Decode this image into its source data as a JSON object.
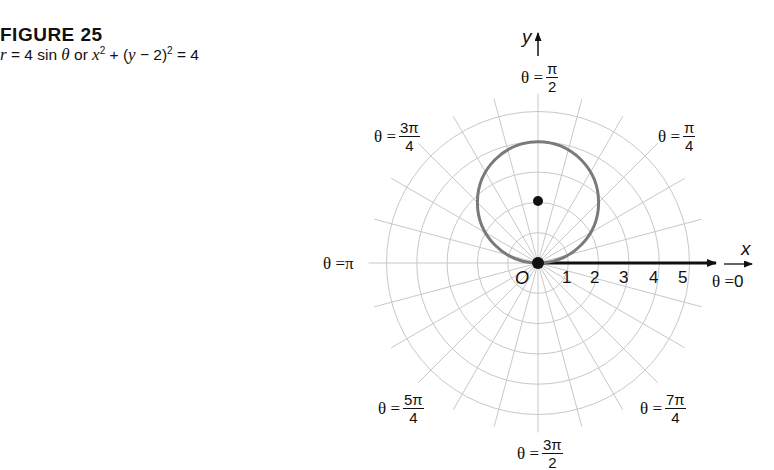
{
  "figure": {
    "title": "FIGURE 25",
    "caption": {
      "r": "r",
      "eq1": " = 4 sin ",
      "theta": "θ",
      "or": " or ",
      "x": "x",
      "exp1": "2",
      "mid": " + (",
      "y": "y",
      "mid2": " − 2)",
      "exp2": "2",
      "end": " = 4"
    }
  },
  "chart_data": {
    "type": "polar",
    "title": "FIGURE 25",
    "subtitle": "r = 4 sin θ or x² + (y − 2)² = 4",
    "equation_polar": "r = 4 sin θ",
    "equation_rectangular": "x^2 + (y - 2)^2 = 4",
    "curve": {
      "shape": "circle",
      "center_xy": [
        0,
        2
      ],
      "radius": 2,
      "color": "#7a7a7a"
    },
    "points": [
      {
        "label": "pole",
        "x": 0,
        "y": 0
      },
      {
        "label": "center",
        "x": 0,
        "y": 2
      }
    ],
    "grid": {
      "on": true,
      "rings": [
        1,
        2,
        3,
        4,
        5
      ],
      "radial_step_deg": 15,
      "color": "#c8c8c8"
    },
    "polar_axis_ticks": [
      "1",
      "2",
      "3",
      "4",
      "5"
    ],
    "pole_label": "O",
    "xlabel": "x",
    "ylabel": "y",
    "angle_labels": [
      {
        "prefix": "θ = ",
        "num": "",
        "den": "",
        "whole": "0",
        "angle": "0"
      },
      {
        "prefix": "θ = ",
        "num": "π",
        "den": "4",
        "angle": "π/4"
      },
      {
        "prefix": "θ = ",
        "num": "π",
        "den": "2",
        "angle": "π/2"
      },
      {
        "prefix": "θ = ",
        "num": "3π",
        "den": "4",
        "angle": "3π/4"
      },
      {
        "prefix": "θ = ",
        "num": "",
        "den": "",
        "whole": "π",
        "angle": "π"
      },
      {
        "prefix": "θ = ",
        "num": "5π",
        "den": "4",
        "angle": "5π/4"
      },
      {
        "prefix": "θ = ",
        "num": "3π",
        "den": "2",
        "angle": "3π/2"
      },
      {
        "prefix": "θ = ",
        "num": "7π",
        "den": "4",
        "angle": "7π/4"
      }
    ],
    "rlim": [
      0,
      5
    ]
  }
}
